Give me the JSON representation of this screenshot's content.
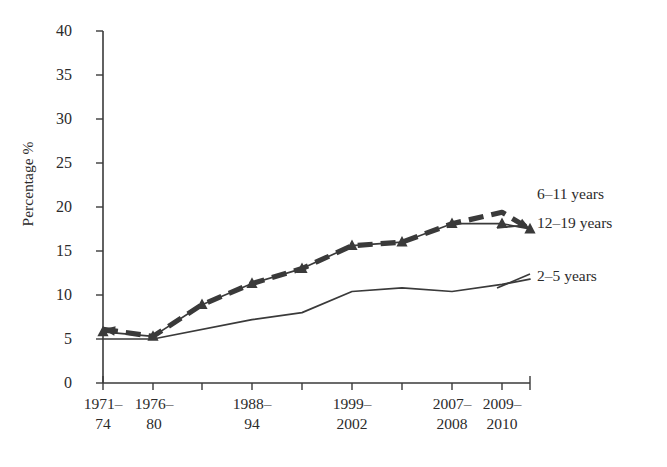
{
  "chart_data": {
    "type": "line",
    "title": "",
    "xlabel": "",
    "ylabel": "Percentage %",
    "ylim": [
      0,
      40
    ],
    "ytick_step": 5,
    "yticks": [
      "40",
      "35",
      "30",
      "25",
      "20",
      "15",
      "10",
      "5",
      "0"
    ],
    "grid": false,
    "legend_position": "inline-right-of-line-ends",
    "categories": [
      "1971–74",
      "1976–80",
      "1988–94",
      "1999–2002",
      "2007–2008",
      "2009–2010"
    ],
    "category_labels": [
      {
        "line1": "1971–",
        "line2": "74"
      },
      {
        "line1": "1976–",
        "line2": "80"
      },
      {
        "line1": "1988–",
        "line2": "94"
      },
      {
        "line1": "1999–",
        "line2": "2002"
      },
      {
        "line1": "2007–",
        "line2": "2008"
      },
      {
        "line1": "2009–",
        "line2": "2010"
      }
    ],
    "x_positions": [
      103,
      153,
      252,
      352,
      452,
      502
    ],
    "axis_tick_positions": [
      103,
      153,
      202,
      252,
      302,
      352,
      402,
      452,
      502,
      530
    ],
    "series": [
      {
        "name": "2–5 years",
        "style": "solid-thin",
        "marker": "none",
        "x": [
          103,
          153,
          252,
          302,
          352,
          402,
          452,
          502,
          530
        ],
        "values": [
          5.0,
          5.0,
          7.2,
          8.0,
          10.4,
          10.8,
          10.4,
          11.2,
          11.8
        ]
      },
      {
        "name": "6–11 years",
        "style": "dashed-thick",
        "marker": "arrow-both-ends",
        "x": [
          103,
          153,
          202,
          252,
          302,
          352,
          402,
          452,
          502,
          530
        ],
        "values": [
          6.1,
          5.3,
          8.9,
          11.3,
          13.0,
          15.6,
          16.0,
          18.1,
          19.4,
          17.5
        ]
      },
      {
        "name": "12–19 years",
        "style": "solid-thin",
        "marker": "triangle",
        "x": [
          103,
          153,
          202,
          252,
          302,
          352,
          402,
          452,
          502,
          530
        ],
        "values": [
          5.8,
          5.3,
          8.9,
          11.3,
          13.0,
          15.6,
          16.0,
          18.1,
          18.1,
          17.5
        ]
      }
    ],
    "annotations": [
      {
        "text": "6–11 years",
        "x": 537,
        "y": 193
      },
      {
        "text": "12–19 years",
        "x": 537,
        "y": 222
      },
      {
        "text": "2–5 years",
        "x": 537,
        "y": 275
      }
    ]
  }
}
